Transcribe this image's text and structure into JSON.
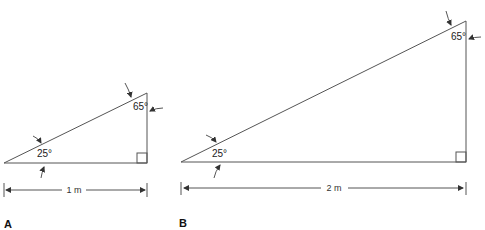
{
  "figure": {
    "panels": [
      {
        "id": "A",
        "label": "A",
        "base_dimension": "1 m",
        "angle_left": "25°",
        "angle_top": "65°",
        "right_angle_marker": true
      },
      {
        "id": "B",
        "label": "B",
        "base_dimension": "2 m",
        "angle_left": "25°",
        "angle_top": "65°",
        "right_angle_marker": true
      }
    ],
    "colors": {
      "line": "#555555",
      "text": "#222222",
      "background": "#ffffff"
    }
  }
}
